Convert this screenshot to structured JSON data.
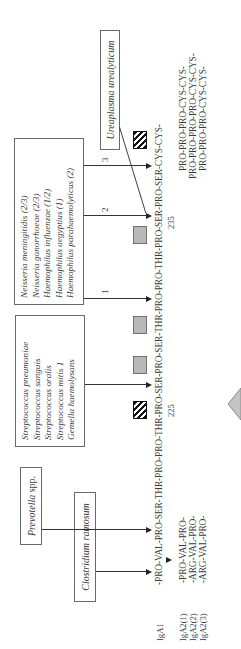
{
  "boxes": {
    "prevotella": {
      "species": "Prevotella",
      "suffix": " spp."
    },
    "clostridium": {
      "label": "Clostridium ramosum"
    },
    "streptococcus": {
      "lines": [
        "Streptococcus pneumoniae",
        "Streptococcus sanguis",
        "Streptococcus oralis",
        "Streptococcus mitis 1",
        "Gemella haemolysans"
      ]
    },
    "neisseria": {
      "lines": [
        "Neisseria meningitidis (2/3)",
        "Neisseria gonorrhoeae (2/3)",
        "Haemophilus influenzae (1/2)",
        "Haemophilus aegyptius (1)",
        "Haemophilus parahaemolyticus (2)"
      ]
    },
    "ureaplasma": {
      "label": "Ureaplasma urealyticum"
    }
  },
  "cleavage_labels": {
    "one": "1",
    "two": "2",
    "three": "3"
  },
  "sequence": {
    "iga1_label": "IgA1",
    "iga1_seq": "-PRO-VAL-PRO-SER-THR-PRO-PRO-THR-PRO-SER-PRO-SER-THR-PRO-PRO-THR-PRO-SER-PRO-SER-CYS-CYS-",
    "pos_225": "225",
    "pos_235": "235",
    "iga2_labels": [
      "IgA2(1)",
      "IgA2(2)",
      "IgA2(3)"
    ],
    "iga2_start": [
      "-PRO-VAL-PRO-",
      "-ARG-VAL-PRO-",
      "-ARG-VAL-PRO-"
    ],
    "iga2_end": [
      "PRO-PRO-PRO-CYS-CYS-",
      "PRO-PRO-PRO-PRO-CYS-CYS-",
      "PRO-PRO-PRO-CYS-CYS-"
    ]
  },
  "colors": {
    "gray_marker": "#b9b9b9",
    "hatched_marker": "#111111",
    "border": "#6a6a6a"
  }
}
